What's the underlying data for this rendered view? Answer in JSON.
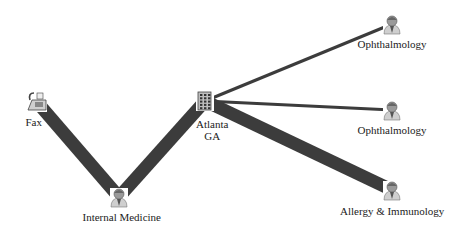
{
  "diagram": {
    "type": "network-graph",
    "edge_color": "#3c3c3c",
    "nodes": [
      {
        "id": "fax",
        "label": "Fax",
        "icon": "fax-icon"
      },
      {
        "id": "atlanta",
        "label_lines": [
          "Atlanta",
          "GA"
        ],
        "icon": "building-icon"
      },
      {
        "id": "internal_medicine",
        "label": "Internal Medicine",
        "icon": "physician-icon"
      },
      {
        "id": "ophthalmology_1",
        "label": "Ophthalmology",
        "icon": "physician-icon"
      },
      {
        "id": "ophthalmology_2",
        "label": "Ophthalmology",
        "icon": "physician-icon"
      },
      {
        "id": "allergy_immunology",
        "label": "Allergy & Immunology",
        "icon": "physician-icon"
      }
    ],
    "edges": [
      {
        "from": "fax",
        "to": "internal_medicine",
        "weight": "heavy"
      },
      {
        "from": "internal_medicine",
        "to": "atlanta",
        "weight": "heavy"
      },
      {
        "from": "atlanta",
        "to": "allergy_immunology",
        "weight": "heavy"
      },
      {
        "from": "atlanta",
        "to": "ophthalmology_1",
        "weight": "light"
      },
      {
        "from": "atlanta",
        "to": "ophthalmology_2",
        "weight": "light"
      }
    ]
  }
}
